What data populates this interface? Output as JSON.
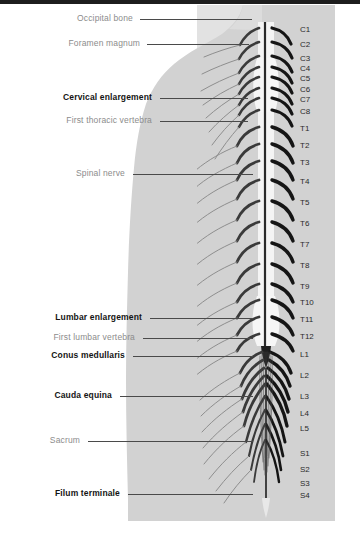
{
  "figure": {
    "panel_color": "#e2e2e2",
    "silhouette_color": "#d2d2d2",
    "leader_color": "#4a4a4a",
    "bold_label_color": "#141414",
    "plain_label_color": "#8c8c8c",
    "level_label_color": "#2b2b2b"
  },
  "left_labels": [
    {
      "text": "Occipital bone",
      "style": "plain",
      "y": 19,
      "text_right": 133,
      "line_x1": 140,
      "line_x2": 252
    },
    {
      "text": "Foramen magnum",
      "style": "plain",
      "y": 44,
      "text_right": 140,
      "line_x1": 147,
      "line_x2": 249
    },
    {
      "text": "Cervical enlargement",
      "style": "bold",
      "y": 98,
      "text_right": 152,
      "line_x1": 160,
      "line_x2": 248
    },
    {
      "text": "First thoracic vertebra",
      "style": "plain",
      "y": 121,
      "text_right": 152,
      "line_x1": 160,
      "line_x2": 248
    },
    {
      "text": "Spinal nerve",
      "style": "plain",
      "y": 174,
      "text_right": 125,
      "line_x1": 133,
      "line_x2": 253
    },
    {
      "text": "Lumbar enlargement",
      "style": "bold",
      "y": 318,
      "text_right": 142,
      "line_x1": 150,
      "line_x2": 253
    },
    {
      "text": "First lumbar vertebra",
      "style": "plain",
      "y": 338,
      "text_right": 135,
      "line_x1": 143,
      "line_x2": 253
    },
    {
      "text": "Conus medullaris",
      "style": "bold",
      "y": 356,
      "text_right": 125,
      "line_x1": 133,
      "line_x2": 253
    },
    {
      "text": "Cauda equina",
      "style": "bold",
      "y": 396,
      "text_right": 112,
      "line_x1": 120,
      "line_x2": 253
    },
    {
      "text": "Sacrum",
      "style": "plain",
      "y": 441,
      "text_right": 80,
      "line_x1": 88,
      "line_x2": 253
    },
    {
      "text": "Filum terminale",
      "style": "bold",
      "y": 494,
      "text_right": 120,
      "line_x1": 128,
      "line_x2": 253
    }
  ],
  "vertebral_levels": [
    {
      "label": "C1",
      "y": 30
    },
    {
      "label": "C2",
      "y": 45
    },
    {
      "label": "C3",
      "y": 59
    },
    {
      "label": "C4",
      "y": 69
    },
    {
      "label": "C5",
      "y": 79
    },
    {
      "label": "C6",
      "y": 90
    },
    {
      "label": "C7",
      "y": 100
    },
    {
      "label": "C8",
      "y": 112
    },
    {
      "label": "T1",
      "y": 129
    },
    {
      "label": "T2",
      "y": 146
    },
    {
      "label": "T3",
      "y": 163
    },
    {
      "label": "T4",
      "y": 182
    },
    {
      "label": "T5",
      "y": 203
    },
    {
      "label": "T6",
      "y": 224
    },
    {
      "label": "T7",
      "y": 245
    },
    {
      "label": "T8",
      "y": 266
    },
    {
      "label": "T9",
      "y": 287
    },
    {
      "label": "T10",
      "y": 303
    },
    {
      "label": "T11",
      "y": 320
    },
    {
      "label": "T12",
      "y": 337
    },
    {
      "label": "L1",
      "y": 355
    },
    {
      "label": "L2",
      "y": 376
    },
    {
      "label": "L3",
      "y": 397
    },
    {
      "label": "L4",
      "y": 414
    },
    {
      "label": "L5",
      "y": 429
    },
    {
      "label": "S1",
      "y": 454
    },
    {
      "label": "S2",
      "y": 470
    },
    {
      "label": "S3",
      "y": 484
    },
    {
      "label": "S4",
      "y": 496
    }
  ],
  "anatomy": {
    "cord_top_y": 22,
    "cord_bottom_y": 360,
    "filum_bottom_y": 512,
    "cord_center_x": 266,
    "nerve_pair_count": 29
  }
}
